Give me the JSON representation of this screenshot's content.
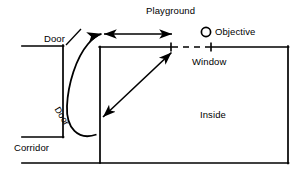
{
  "figure": {
    "type": "floor-plan-schematic",
    "title": "",
    "background_color": "#ffffff",
    "stroke_color": "#000000",
    "width": 304,
    "height": 179
  },
  "labels": {
    "playground": "Playground",
    "objective": "Objective",
    "window": "Window",
    "inside": "Inside",
    "corridor": "Corridor",
    "door_top": "Door",
    "door_rotated": "Door"
  },
  "markers": {
    "objective_shape": "circle-outline",
    "objective_center": [
      206,
      32
    ],
    "objective_radius": 5
  },
  "walls": [
    {
      "name": "corridor-top-wall",
      "from": [
        22,
        46
      ],
      "to": [
        63,
        46
      ]
    },
    {
      "name": "door-jamb-left-vertical",
      "from": [
        63,
        46
      ],
      "to": [
        63,
        137
      ]
    },
    {
      "name": "corridor-bottom-wall",
      "from": [
        22,
        137
      ],
      "to": [
        63,
        137
      ]
    },
    {
      "name": "inside-left-wall",
      "from": [
        100,
        47
      ],
      "to": [
        100,
        163
      ]
    },
    {
      "name": "inside-top-wall-left",
      "from": [
        100,
        47
      ],
      "to": [
        171,
        47
      ]
    },
    {
      "name": "inside-top-wall-right",
      "from": [
        211,
        47
      ],
      "to": [
        288,
        47
      ]
    },
    {
      "name": "inside-right-wall",
      "from": [
        288,
        47
      ],
      "to": [
        288,
        163
      ]
    },
    {
      "name": "bottom-wall",
      "from": [
        22,
        163
      ],
      "to": [
        288,
        163
      ]
    }
  ],
  "window_opening": {
    "name": "window-dashed-opening",
    "from": [
      171,
      47
    ],
    "to": [
      211,
      47
    ],
    "style": "dashed",
    "end_ticks": true
  },
  "arrows": [
    {
      "name": "playground-horizontal-arrow",
      "style": "double-headed straight",
      "from": [
        100,
        34
      ],
      "to": [
        175,
        34
      ]
    },
    {
      "name": "door-loop-curved-arrow",
      "style": "curved single-headed",
      "from": [
        96,
        135
      ],
      "to": [
        100,
        33
      ]
    },
    {
      "name": "inside-diagonal-arrow",
      "style": "double-headed straight",
      "from": [
        174,
        50
      ],
      "to": [
        101,
        119
      ]
    }
  ],
  "leaders": [
    {
      "name": "door-top-leader-line",
      "from": [
        66,
        44
      ],
      "to": [
        80,
        30
      ]
    }
  ]
}
